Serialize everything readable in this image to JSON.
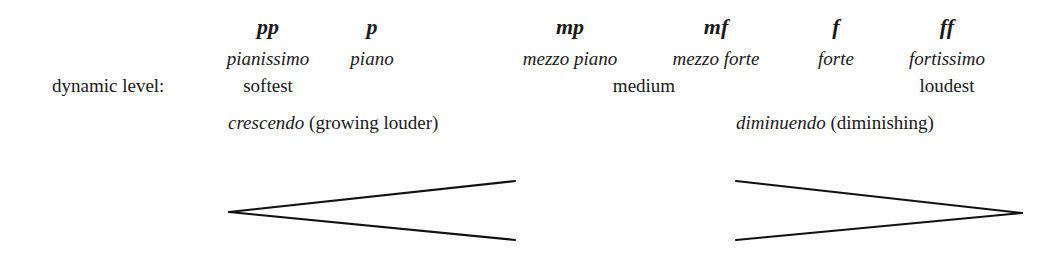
{
  "dynamics": [
    {
      "symbol": "pp",
      "name": "pianissimo"
    },
    {
      "symbol": "p",
      "name": "piano"
    },
    {
      "symbol": "mp",
      "name": "mezzo piano"
    },
    {
      "symbol": "mf",
      "name": "mezzo forte"
    },
    {
      "symbol": "f",
      "name": "forte"
    },
    {
      "symbol": "ff",
      "name": "fortissimo"
    }
  ],
  "level": {
    "label": "dynamic level:",
    "softest": "softest",
    "medium": "medium",
    "loudest": "loudest"
  },
  "crescendo": {
    "term": "crescendo",
    "gloss": "(growing louder)",
    "icon": "crescendo-hairpin-icon"
  },
  "diminuendo": {
    "term": "diminuendo",
    "gloss": "(diminishing)",
    "icon": "diminuendo-hairpin-icon"
  }
}
